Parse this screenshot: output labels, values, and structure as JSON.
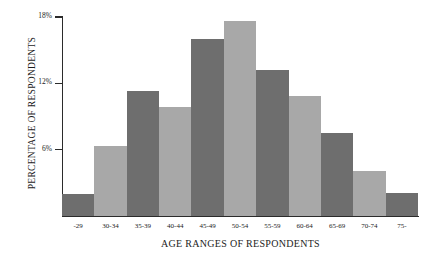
{
  "chart_data": {
    "type": "bar",
    "title": "",
    "xlabel": "AGE RANGES OF RESPONDENTS",
    "ylabel": "PERCENTAGE OF RESPONDENTS",
    "categories": [
      "-29",
      "30-34",
      "35-39",
      "40-44",
      "45-49",
      "50-54",
      "55-59",
      "60-64",
      "65-69",
      "70-74",
      "75-"
    ],
    "values": [
      2.0,
      6.3,
      11.3,
      9.9,
      16.0,
      17.6,
      13.2,
      10.9,
      7.5,
      4.1,
      2.1
    ],
    "ylim": [
      0,
      18
    ],
    "ytick_values": [
      6,
      12,
      18
    ],
    "ytick_labels": [
      "6%",
      "12%",
      "18%"
    ],
    "grid": false,
    "legend": null,
    "bar_colors": [
      "#6e6e6e",
      "#a8a8a8",
      "#6e6e6e",
      "#a8a8a8",
      "#6e6e6e",
      "#a8a8a8",
      "#6e6e6e",
      "#a8a8a8",
      "#6e6e6e",
      "#a8a8a8",
      "#6e6e6e"
    ],
    "axis_color": "#2b2b2b",
    "background": "#ffffff",
    "text_color": "#1c1c1c"
  }
}
